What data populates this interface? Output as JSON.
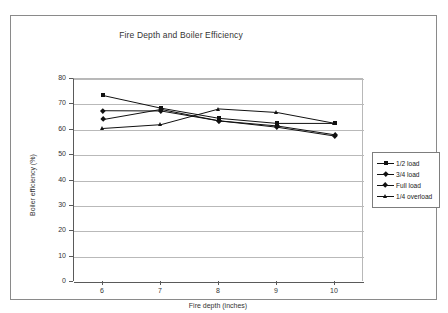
{
  "chart_data": {
    "type": "line",
    "title": "Fire Depth and Boiler Efficiency",
    "xlabel": "Fire depth (inches)",
    "ylabel": "Boiler efficiency (%)",
    "x": [
      6,
      7,
      8,
      9,
      10
    ],
    "xticks": [
      "6",
      "7",
      "8",
      "9",
      "10"
    ],
    "yticks": [
      "0",
      "10",
      "20",
      "30",
      "40",
      "50",
      "60",
      "70",
      "80"
    ],
    "xlim": [
      5.5,
      10.5
    ],
    "ylim": [
      0,
      80
    ],
    "grid": "horizontal",
    "legend_position": "right",
    "line_color": "#111111",
    "grid_color": "#b9b9b9",
    "axis_color": "#5a5a5a",
    "series": [
      {
        "name": "1/2 load",
        "marker": "square",
        "values": [
          73.5,
          68.5,
          64.5,
          62.5,
          62.5
        ]
      },
      {
        "name": "3/4 load",
        "marker": "diamond",
        "values": [
          67.5,
          67.4,
          63.5,
          61.0,
          57.5
        ]
      },
      {
        "name": "Full load",
        "marker": "cross",
        "values": [
          64.0,
          68.0,
          63.5,
          61.5,
          58.0
        ]
      },
      {
        "name": "1/4 overload",
        "marker": "triangle",
        "values": [
          60.5,
          62.0,
          68.2,
          66.8,
          62.5
        ]
      }
    ]
  },
  "legend": {
    "items": [
      {
        "label": "1/2 load"
      },
      {
        "label": "3/4 load"
      },
      {
        "label": "Full load"
      },
      {
        "label": "1/4 overload"
      }
    ]
  }
}
